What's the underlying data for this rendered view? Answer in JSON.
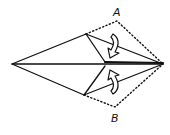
{
  "diagram": {
    "type": "origami-fold-step",
    "labels": {
      "flap_a": "A",
      "flap_b": "B"
    },
    "instructions": "Fold flaps A and B inward along the center line",
    "colors": {
      "line": "#111111",
      "background": "#ffffff"
    }
  }
}
